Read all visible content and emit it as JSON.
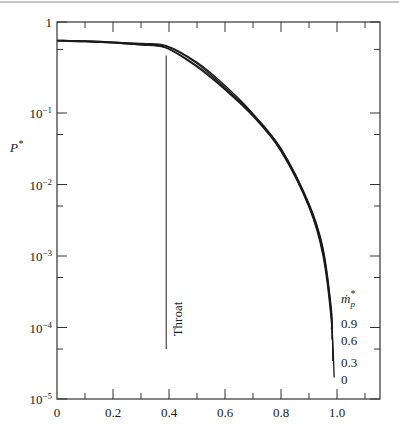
{
  "chart_data": {
    "type": "line",
    "title": "",
    "xlabel": "",
    "ylabel": "P*",
    "yscale": "log",
    "xlim": [
      0,
      1.15
    ],
    "ylim": [
      1e-05,
      1
    ],
    "grid": false,
    "x_ticks": [
      "0",
      "0.2",
      "0.4",
      "0.6",
      "0.8",
      "1.0"
    ],
    "x_tick_values": [
      0,
      0.2,
      0.4,
      0.6,
      0.8,
      1.0
    ],
    "y_ticks": [
      "1",
      "10⁻¹",
      "10⁻²",
      "10⁻³",
      "10⁻⁴",
      "10⁻⁵"
    ],
    "y_tick_values": [
      1,
      0.1,
      0.01,
      0.001,
      0.0001,
      1e-05
    ],
    "legend": {
      "title": "ṁp*",
      "title_main": "ṁ",
      "title_sub": "p",
      "title_sup": "*",
      "position": "right, inline at curve ends",
      "entries": [
        "0.9",
        "0.6",
        "0.3",
        "0"
      ]
    },
    "annotations": [
      {
        "text": "Throat",
        "type": "vertical-line",
        "x": 0.39,
        "y_from": 5e-05,
        "y_to": 0.55
      }
    ],
    "x": [
      0,
      0.1,
      0.2,
      0.3,
      0.39,
      0.5,
      0.6,
      0.7,
      0.8,
      0.9,
      0.95,
      0.98
    ],
    "series": [
      {
        "name": "0",
        "values": [
          0.62,
          0.61,
          0.59,
          0.56,
          0.52,
          0.32,
          0.18,
          0.09,
          0.029,
          0.0048,
          0.001,
          0.00012
        ],
        "end": [
          0.99,
          2e-05
        ]
      },
      {
        "name": "0.3",
        "values": [
          0.62,
          0.61,
          0.59,
          0.56,
          0.52,
          0.33,
          0.185,
          0.092,
          0.03,
          0.005,
          0.0011,
          0.00014
        ],
        "end": [
          0.985,
          3.4e-05
        ]
      },
      {
        "name": "0.6",
        "values": [
          0.63,
          0.62,
          0.6,
          0.57,
          0.54,
          0.35,
          0.19,
          0.095,
          0.031,
          0.0052,
          0.0012,
          0.00016
        ],
        "end": [
          0.982,
          6.8e-05
        ]
      },
      {
        "name": "0.9",
        "values": [
          0.63,
          0.62,
          0.6,
          0.58,
          0.55,
          0.36,
          0.2,
          0.098,
          0.032,
          0.0054,
          0.0013,
          0.00018
        ],
        "end": [
          0.98,
          9.5e-05
        ]
      }
    ]
  },
  "labels": {
    "ylabel": "P*",
    "throat": "Throat",
    "legend_m": "ṁ",
    "legend_sub": "p",
    "legend_sup": "*"
  }
}
